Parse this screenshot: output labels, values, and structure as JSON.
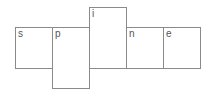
{
  "diagram": {
    "cells": [
      {
        "label": "s",
        "x": 15,
        "y": 27,
        "w": 38,
        "h": 42
      },
      {
        "label": "p",
        "x": 52,
        "y": 27,
        "w": 38,
        "h": 62
      },
      {
        "label": "i",
        "x": 89,
        "y": 7,
        "w": 38,
        "h": 62
      },
      {
        "label": "n",
        "x": 126,
        "y": 27,
        "w": 38,
        "h": 42
      },
      {
        "label": "e",
        "x": 163,
        "y": 27,
        "w": 38,
        "h": 42
      }
    ]
  }
}
